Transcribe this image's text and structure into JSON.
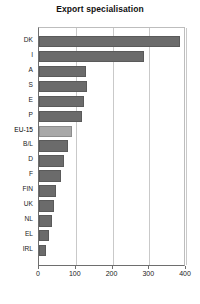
{
  "chart_data": {
    "type": "bar",
    "orientation": "horizontal",
    "title": "Export specialisation",
    "xlabel": "",
    "ylabel": "",
    "categories": [
      "DK",
      "I",
      "A",
      "S",
      "E",
      "P",
      "EU-15",
      "B/L",
      "D",
      "F",
      "FIN",
      "UK",
      "NL",
      "EL",
      "IRL"
    ],
    "values": [
      385,
      285,
      128,
      130,
      122,
      118,
      90,
      78,
      68,
      60,
      45,
      42,
      36,
      28,
      18
    ],
    "xlim": [
      0,
      400
    ],
    "ylim": null,
    "xticks": [
      0,
      100,
      200,
      300,
      400
    ],
    "xticklabels": [
      "0",
      "100",
      "200",
      "300",
      "400"
    ],
    "grid": "vertical",
    "legend": "none",
    "highlight_category": "EU-15",
    "colors": {
      "bar": "#6b6b6b",
      "bar_highlight": "#a8a8a8",
      "grid": "#c9c9c9",
      "axis": "#6e6e6e",
      "background": "#ffffff",
      "text": "#1a1a1a"
    }
  }
}
